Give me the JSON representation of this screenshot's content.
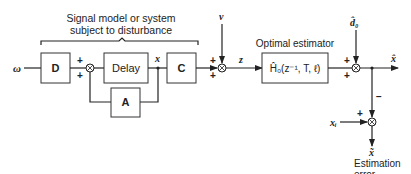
{
  "diagram": {
    "type": "block-diagram",
    "group_label": {
      "line1": "Signal model or system",
      "line2": "subject to disturbance"
    },
    "estimator_label": "Optimal estimator",
    "blocks": {
      "D": "D",
      "delay": "Delay",
      "A": "A",
      "C": "C",
      "estimator": "Ĥ₀(z⁻¹, T, ℓ)"
    },
    "signals": {
      "input": "ω",
      "state": "x",
      "noise": "v",
      "measurement": "z",
      "disturbance_estimate": "d̂₀",
      "estimate": "x̂",
      "reference": "xᵢ",
      "error": "x̃"
    },
    "signs": {
      "sum1_top": "+",
      "sum1_bottom": "+",
      "sum2_top": "+",
      "sum2_bottom": "+",
      "sum3_top": "+",
      "sum3_bottom": "+",
      "sum4_left": "+",
      "sum4_top": "−"
    },
    "error_label": {
      "line1": "Estimation",
      "line2": "error"
    }
  }
}
